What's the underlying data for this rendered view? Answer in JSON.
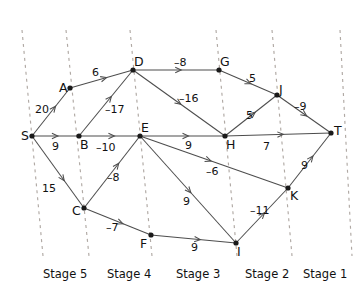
{
  "diagram": {
    "width": 361,
    "height": 295,
    "colors": {
      "background": "#ffffff",
      "edge": "#4d4d4d",
      "node": "#1a1a1a",
      "divider": "#b0a9a4",
      "text": "#111111"
    },
    "nodes": [
      {
        "id": "S",
        "label": "S",
        "x": 32,
        "y": 136,
        "lx": 21,
        "ly": 130
      },
      {
        "id": "A",
        "label": "A",
        "x": 70,
        "y": 88,
        "lx": 59,
        "ly": 82
      },
      {
        "id": "B",
        "label": "B",
        "x": 79,
        "y": 136,
        "lx": 80,
        "ly": 139
      },
      {
        "id": "C",
        "label": "C",
        "x": 84,
        "y": 208,
        "lx": 72,
        "ly": 205
      },
      {
        "id": "D",
        "label": "D",
        "x": 133,
        "y": 70,
        "lx": 134,
        "ly": 56
      },
      {
        "id": "E",
        "label": "E",
        "x": 140,
        "y": 136,
        "lx": 141,
        "ly": 122
      },
      {
        "id": "F",
        "label": "F",
        "x": 151,
        "y": 235,
        "lx": 140,
        "ly": 238
      },
      {
        "id": "G",
        "label": "G",
        "x": 219,
        "y": 70,
        "lx": 220,
        "ly": 56
      },
      {
        "id": "H",
        "label": "H",
        "x": 225,
        "y": 136,
        "lx": 226,
        "ly": 139
      },
      {
        "id": "I",
        "label": "I",
        "x": 236,
        "y": 243,
        "lx": 237,
        "ly": 246
      },
      {
        "id": "J",
        "label": "J",
        "x": 277,
        "y": 95,
        "lx": 279,
        "ly": 84
      },
      {
        "id": "K",
        "label": "K",
        "x": 288,
        "y": 188,
        "lx": 290,
        "ly": 190
      },
      {
        "id": "T",
        "label": "T",
        "x": 331,
        "y": 133,
        "lx": 334,
        "ly": 125
      }
    ],
    "edges": [
      {
        "from": "S",
        "to": "A",
        "weight": "20",
        "lx": 35,
        "ly": 104,
        "ax": 0.62
      },
      {
        "from": "S",
        "to": "B",
        "weight": "9",
        "lx": 52,
        "ly": 141,
        "ax": 0.55
      },
      {
        "from": "S",
        "to": "C",
        "weight": "15",
        "lx": 42,
        "ly": 183,
        "ax": 0.62
      },
      {
        "from": "A",
        "to": "D",
        "weight": "6",
        "lx": 92,
        "ly": 67,
        "ax": 0.58
      },
      {
        "from": "B",
        "to": "D",
        "weight": "-17",
        "lx": 105,
        "ly": 104,
        "ax": 0.6
      },
      {
        "from": "B",
        "to": "E",
        "weight": "-10",
        "lx": 96,
        "ly": 142,
        "ax": 0.58
      },
      {
        "from": "C",
        "to": "E",
        "weight": "-8",
        "lx": 107,
        "ly": 172,
        "ax": 0.62
      },
      {
        "from": "C",
        "to": "F",
        "weight": "-7",
        "lx": 106,
        "ly": 222,
        "ax": 0.58
      },
      {
        "from": "D",
        "to": "G",
        "weight": "-8",
        "lx": 174,
        "ly": 57,
        "ax": 0.56
      },
      {
        "from": "D",
        "to": "H",
        "weight": "-16",
        "lx": 179,
        "ly": 93,
        "ax": 0.52
      },
      {
        "from": "E",
        "to": "H",
        "weight": "9",
        "lx": 185,
        "ly": 140,
        "ax": 0.57
      },
      {
        "from": "E",
        "to": "K",
        "weight": "-6",
        "lx": 206,
        "ly": 166,
        "ax": 0.48
      },
      {
        "from": "E",
        "to": "I",
        "weight": "9",
        "lx": 183,
        "ly": 196,
        "ax": 0.53
      },
      {
        "from": "F",
        "to": "I",
        "weight": "9",
        "lx": 191,
        "ly": 242,
        "ax": 0.58
      },
      {
        "from": "G",
        "to": "J",
        "weight": "5",
        "lx": 249,
        "ly": 73,
        "ax": 0.55
      },
      {
        "from": "H",
        "to": "J",
        "weight": "5",
        "lx": 246,
        "ly": 110,
        "ax": 0.58
      },
      {
        "from": "H",
        "to": "T",
        "weight": "7",
        "lx": 263,
        "ly": 141,
        "ax": 0.55
      },
      {
        "from": "I",
        "to": "K",
        "weight": "-11",
        "lx": 250,
        "ly": 205,
        "ax": 0.55
      },
      {
        "from": "J",
        "to": "T",
        "weight": "-9",
        "lx": 294,
        "ly": 101,
        "ax": 0.55
      },
      {
        "from": "K",
        "to": "T",
        "weight": "9",
        "lx": 301,
        "ly": 160,
        "ax": 0.58
      }
    ],
    "dividers": [
      {
        "x_top": 22,
        "x_bottom": 43,
        "label": "",
        "lx": 0,
        "ly": 0
      },
      {
        "x_top": 66,
        "x_bottom": 89,
        "label": "Stage 5",
        "lx": 43,
        "ly": 269
      },
      {
        "x_top": 130,
        "x_bottom": 152,
        "label": "Stage 4",
        "lx": 107,
        "ly": 269
      },
      {
        "x_top": 216,
        "x_bottom": 237,
        "label": "Stage 3",
        "lx": 176,
        "ly": 269
      },
      {
        "x_top": 272,
        "x_bottom": 292,
        "label": "Stage 2",
        "lx": 245,
        "ly": 269
      },
      {
        "x_top": 340,
        "x_bottom": 352,
        "label": "Stage 1",
        "lx": 303,
        "ly": 269
      }
    ],
    "divider_y_top": 30,
    "divider_y_bottom": 256
  }
}
